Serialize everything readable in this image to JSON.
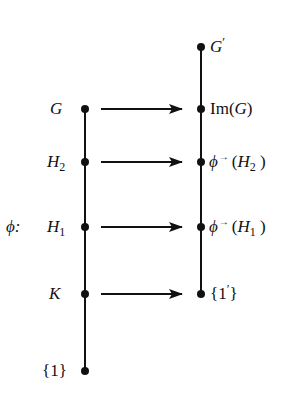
{
  "diagram": {
    "map_label": {
      "symbol": "ϕ",
      "colon": ":"
    },
    "left_chain": {
      "x": 85,
      "nodes": [
        {
          "id": "G",
          "main": "G",
          "sub": "",
          "y": 109
        },
        {
          "id": "H2",
          "main": "H",
          "sub": "2",
          "y": 162
        },
        {
          "id": "H1",
          "main": "H",
          "sub": "1",
          "y": 227
        },
        {
          "id": "K",
          "main": "K",
          "sub": "",
          "y": 294
        },
        {
          "id": "trivial",
          "main": "{1}",
          "sub": "",
          "y": 371
        }
      ]
    },
    "right_chain": {
      "x": 201,
      "nodes": [
        {
          "id": "Gprime",
          "text": "G′",
          "y": 47
        },
        {
          "id": "ImG",
          "text": "Im(G)",
          "y": 109
        },
        {
          "id": "phiH2",
          "text": "ϕ→(H2)",
          "y": 162
        },
        {
          "id": "phiH1",
          "text": "ϕ→(H1)",
          "y": 227
        },
        {
          "id": "trivialprime",
          "text": "{1′}",
          "y": 294
        }
      ]
    },
    "arrows": [
      {
        "from": "G",
        "to": "ImG",
        "y": 109,
        "x1": 101,
        "x2": 182
      },
      {
        "from": "H2",
        "to": "phiH2",
        "y": 162,
        "x1": 101,
        "x2": 182
      },
      {
        "from": "H1",
        "to": "phiH1",
        "y": 227,
        "x1": 101,
        "x2": 182
      },
      {
        "from": "K",
        "to": "trivialprime",
        "y": 294,
        "x1": 101,
        "x2": 182
      }
    ],
    "labels": {
      "phi_colon": "ϕ:",
      "G": "G",
      "H": "H",
      "sub2": "2",
      "sub1": "1",
      "K": "K",
      "trivial": "{1}",
      "G_prime_main": "G",
      "prime": "′",
      "Im": "Im(",
      "G_in_im": "G",
      "close_paren": ")",
      "phi": "ϕ",
      "arrow_sup": "→",
      "open_paren": " (",
      "trivial_prime_open": "{1",
      "trivial_prime_close": "}"
    },
    "colors": {
      "ink": "#111111",
      "background": "#ffffff"
    }
  }
}
